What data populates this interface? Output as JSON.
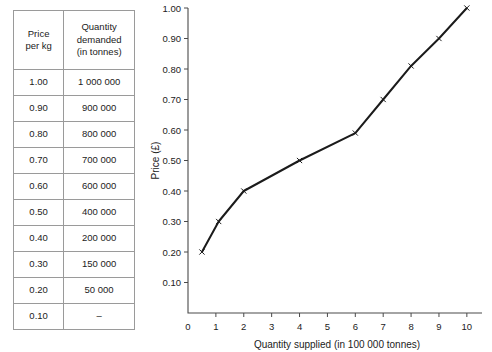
{
  "table": {
    "headers": [
      "Price\nper kg",
      "Quantity\ndemanded\n(in tonnes)"
    ],
    "header_price_line1": "Price",
    "header_price_line2": "per kg",
    "header_qty_line1": "Quantity",
    "header_qty_line2": "demanded",
    "header_qty_line3": "(in tonnes)",
    "rows": [
      {
        "price": "1.00",
        "quantity": "1 000 000"
      },
      {
        "price": "0.90",
        "quantity": "900 000"
      },
      {
        "price": "0.80",
        "quantity": "800 000"
      },
      {
        "price": "0.70",
        "quantity": "700 000"
      },
      {
        "price": "0.60",
        "quantity": "600 000"
      },
      {
        "price": "0.50",
        "quantity": "400 000"
      },
      {
        "price": "0.40",
        "quantity": "200 000"
      },
      {
        "price": "0.30",
        "quantity": "150 000"
      },
      {
        "price": "0.20",
        "quantity": "50 000"
      },
      {
        "price": "0.10",
        "quantity": "–"
      }
    ]
  },
  "chart_data": {
    "type": "line",
    "title": "",
    "xlabel": "Quantity supplied (in 100 000 tonnes)",
    "ylabel": "Price (£)",
    "xlim": [
      0,
      10.4
    ],
    "ylim": [
      0,
      1.0
    ],
    "xticks": [
      0,
      1,
      2,
      3,
      4,
      5,
      6,
      7,
      8,
      9,
      10
    ],
    "xtick_labels": [
      "0",
      "1",
      "2",
      "3",
      "4",
      "5",
      "6",
      "7",
      "8",
      "9",
      "10"
    ],
    "yticks": [
      0.1,
      0.2,
      0.3,
      0.4,
      0.5,
      0.6,
      0.7,
      0.8,
      0.9,
      1.0
    ],
    "ytick_labels": [
      "0.10",
      "0.20",
      "0.30",
      "0.40",
      "0.50",
      "0.60",
      "0.70",
      "0.80",
      "0.90",
      "1.00"
    ],
    "grid": false,
    "legend": null,
    "marker": "x",
    "series": [
      {
        "name": "Supply",
        "color": "#1b1b1b",
        "points": [
          {
            "x": 0.5,
            "y": 0.2
          },
          {
            "x": 1.1,
            "y": 0.3
          },
          {
            "x": 2.0,
            "y": 0.4
          },
          {
            "x": 4.0,
            "y": 0.5
          },
          {
            "x": 6.0,
            "y": 0.59
          },
          {
            "x": 7.0,
            "y": 0.7
          },
          {
            "x": 8.0,
            "y": 0.81
          },
          {
            "x": 9.0,
            "y": 0.9
          },
          {
            "x": 10.0,
            "y": 1.0
          }
        ]
      }
    ]
  }
}
